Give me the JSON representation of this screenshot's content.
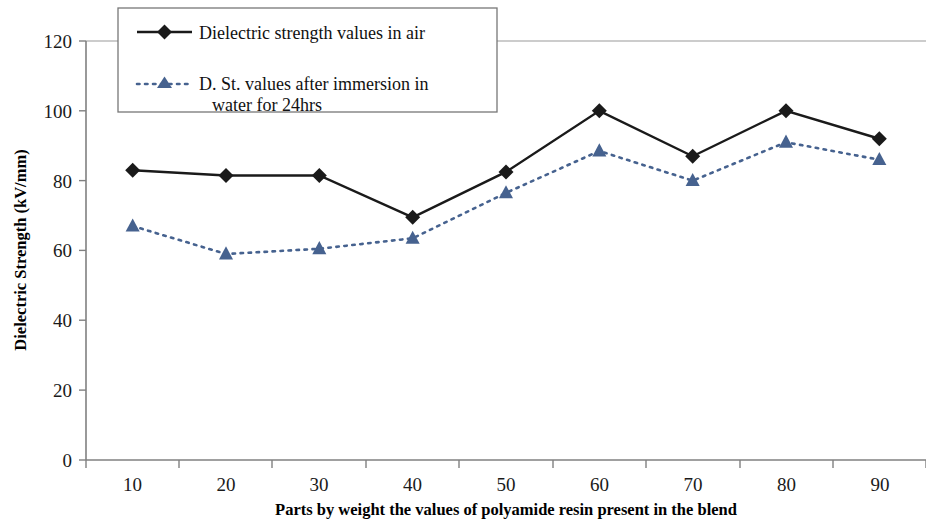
{
  "chart_data": {
    "type": "line",
    "title": "",
    "xlabel": "Parts by weight the values of polyamide resin present in the blend",
    "ylabel": "Dielectric Strength (kV/mm)",
    "categories": [
      "10",
      "20",
      "30",
      "40",
      "50",
      "60",
      "70",
      "80",
      "90"
    ],
    "ylim": [
      0,
      120
    ],
    "yticks": [
      "0",
      "20",
      "40",
      "60",
      "80",
      "100",
      "120"
    ],
    "grid": false,
    "legend_position": "top-left-inside",
    "series": [
      {
        "name": "Dielectric strength values in air",
        "marker": "diamond",
        "line_style": "solid",
        "color": "#1a1a1a",
        "values": [
          83,
          81.5,
          81.5,
          69.5,
          82.5,
          100,
          87,
          100,
          92
        ]
      },
      {
        "name": "D. St. values after immersion in water for 24hrs",
        "marker": "triangle",
        "line_style": "dotted",
        "color": "#46628f",
        "values": [
          67,
          59,
          60.5,
          63.5,
          76.5,
          88.5,
          80,
          91,
          86
        ]
      }
    ]
  },
  "legend": {
    "entries": [
      {
        "label": "Dielectric strength values in air"
      },
      {
        "label": "D. St. values after immersion in",
        "label2": "water for 24hrs"
      }
    ]
  },
  "colors": {
    "series_air": "#1a1a1a",
    "series_water": "#46628f",
    "axis": "#808080",
    "grid": "#9a9a9a",
    "background": "#ffffff"
  }
}
